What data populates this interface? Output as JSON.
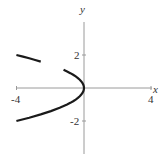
{
  "chart_data": {
    "type": "line",
    "title": "",
    "xlabel": "x",
    "ylabel": "y",
    "xlim": [
      -4,
      4
    ],
    "ylim": [
      -3.5,
      3.9
    ],
    "grid": false,
    "legend": null,
    "x_ticks": [
      {
        "value": -4,
        "label": "-4"
      },
      {
        "value": 4,
        "label": "4"
      }
    ],
    "y_ticks": [
      {
        "value": 2,
        "label": "2"
      },
      {
        "value": -2,
        "label": "-2"
      }
    ],
    "relation": "x = -y^2",
    "series": [
      {
        "name": "upper-branch-far",
        "points": [
          [
            -4,
            2
          ],
          [
            -3.61,
            1.9
          ],
          [
            -3.24,
            1.8
          ],
          [
            -2.89,
            1.7
          ],
          [
            -2.56,
            1.6
          ]
        ]
      },
      {
        "name": "upper-branch-near",
        "points": [
          [
            -1.21,
            1.1
          ],
          [
            -1.0,
            1.0
          ],
          [
            -0.81,
            0.9
          ],
          [
            -0.64,
            0.8
          ],
          [
            -0.49,
            0.7
          ],
          [
            -0.36,
            0.6
          ],
          [
            -0.25,
            0.5
          ],
          [
            -0.16,
            0.4
          ],
          [
            -0.09,
            0.3
          ],
          [
            -0.04,
            0.2
          ],
          [
            -0.01,
            0.1
          ],
          [
            0,
            0
          ]
        ]
      },
      {
        "name": "lower-branch",
        "points": [
          [
            0,
            0
          ],
          [
            -0.01,
            -0.1
          ],
          [
            -0.04,
            -0.2
          ],
          [
            -0.09,
            -0.3
          ],
          [
            -0.16,
            -0.4
          ],
          [
            -0.25,
            -0.5
          ],
          [
            -0.36,
            -0.6
          ],
          [
            -0.49,
            -0.7
          ],
          [
            -0.64,
            -0.8
          ],
          [
            -0.81,
            -0.9
          ],
          [
            -1.0,
            -1.0
          ],
          [
            -1.44,
            -1.2
          ],
          [
            -1.96,
            -1.4
          ],
          [
            -2.56,
            -1.6
          ],
          [
            -3.24,
            -1.8
          ],
          [
            -4,
            -2
          ]
        ]
      }
    ]
  },
  "labels": {
    "x_axis": "x",
    "y_axis": "y",
    "x_min": "-4",
    "x_max": "4",
    "y_pos": "2",
    "y_neg": "-2"
  }
}
